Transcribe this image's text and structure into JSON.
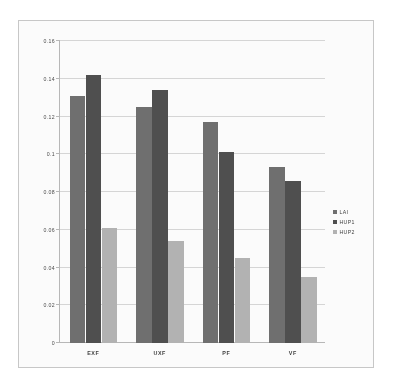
{
  "chart_data": {
    "type": "bar",
    "title": "",
    "subtitle": "",
    "xlabel": "",
    "ylabel": "",
    "categories": [
      "EXF",
      "UXF",
      "PF",
      "VF"
    ],
    "series": [
      {
        "name": "LAI",
        "values": [
          0.131,
          0.125,
          0.117,
          0.093
        ],
        "color": "#6e6e6e"
      },
      {
        "name": "HUP1",
        "values": [
          0.142,
          0.134,
          0.101,
          0.086
        ],
        "color": "#4d4d4d"
      },
      {
        "name": "HUP2",
        "values": [
          0.061,
          0.054,
          0.045,
          0.035
        ],
        "color": "#b4b4b4"
      }
    ],
    "ylim": [
      0,
      0.16
    ],
    "ytick_values": [
      0,
      0.02,
      0.04,
      0.06,
      0.08,
      0.1,
      0.12,
      0.14,
      0.16
    ],
    "ytick_labels": [
      "0",
      "0.02",
      "0.04",
      "0.06",
      "0.08",
      "0.1",
      "0.12",
      "0.14",
      "0.16"
    ],
    "grid": true,
    "grid_axis": "y",
    "legend_position": "right",
    "legend_entries": [
      "LAI",
      "HUP1",
      "HUP2"
    ],
    "annotations": []
  },
  "figure": {
    "frame_color": "#c9c9c9",
    "background": "#ffffff",
    "grid_color": "#d8d8d8",
    "axis_color": "#b9b9b9"
  }
}
